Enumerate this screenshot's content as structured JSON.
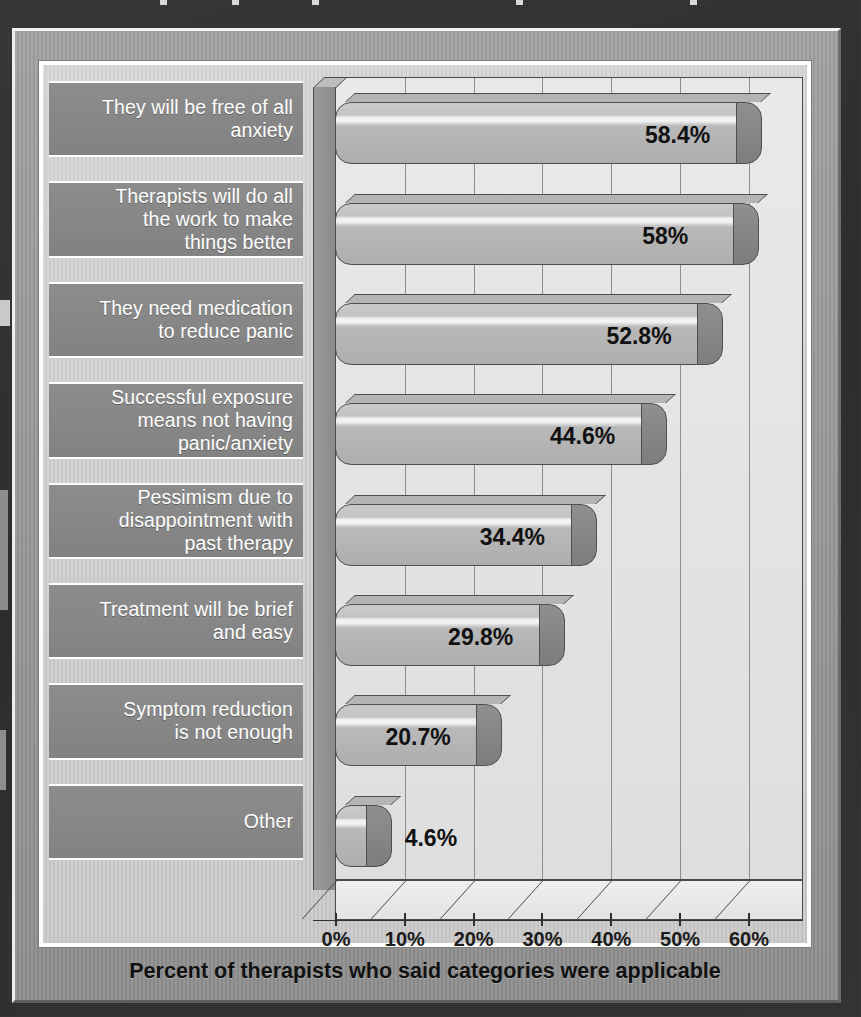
{
  "chart_data": {
    "type": "bar",
    "orientation": "horizontal",
    "title": "",
    "xlabel": "Percent of therapists who said categories were applicable",
    "ylabel": "",
    "xlim": [
      0,
      68
    ],
    "xticks": [
      "0%",
      "10%",
      "20%",
      "30%",
      "40%",
      "50%",
      "60%"
    ],
    "xtick_values": [
      0,
      10,
      20,
      30,
      40,
      50,
      60
    ],
    "grid": "vertical",
    "legend": "none",
    "categories": [
      "They will be free of all\nanxiety",
      "Therapists will do all\nthe work to make\nthings better",
      "They need medication\nto reduce panic",
      "Successful exposure\nmeans not having\npanic/anxiety",
      "Pessimism due to\ndisappointment with\npast therapy",
      "Treatment will be brief\nand easy",
      "Symptom reduction\nis not enough",
      "Other"
    ],
    "values": [
      58.4,
      58,
      52.8,
      44.6,
      34.4,
      29.8,
      20.7,
      4.6
    ],
    "value_labels": [
      "58.4%",
      "58%",
      "52.8%",
      "44.6%",
      "34.4%",
      "29.8%",
      "20.7%",
      "4.6%"
    ]
  },
  "caption": {
    "text": "Percent of therapists who said categories were applicable"
  },
  "colors": {
    "backdrop": "#2e2e2e",
    "frame": "#989898",
    "panel": "#d3d3d3",
    "label_band": "#878787",
    "label_text": "#ffffff",
    "bar_face": "#bdbdbd",
    "bar_cap": "#868686",
    "bar_outline": "#4f4f4f",
    "value_text": "#111111",
    "axis": "#2f2f2f"
  }
}
